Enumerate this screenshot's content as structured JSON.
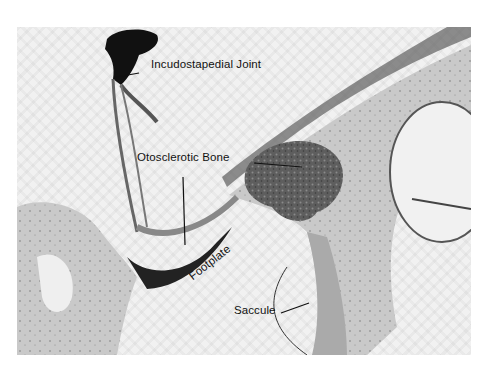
{
  "figure": {
    "type": "histology micrograph (grayscale)",
    "labels": [
      {
        "id": "incudostapedial",
        "text": "Incudostapedial Joint"
      },
      {
        "id": "otosclerotic",
        "text": "Otosclerotic Bone"
      },
      {
        "id": "footplate",
        "text": "Footplate"
      },
      {
        "id": "saccule",
        "text": "Saccule"
      }
    ]
  },
  "colors": {
    "background": "#ffffff",
    "field": "#f1f1f1",
    "bone": "#c8c8c8",
    "otosclerotic_bone": "#5a5a5a",
    "dark_tissue": "#1e1e1e",
    "label_text": "#111111"
  }
}
